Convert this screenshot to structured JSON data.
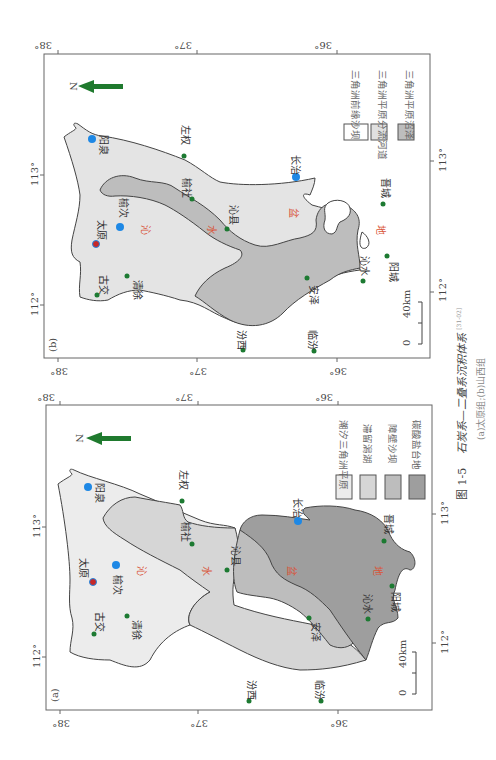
{
  "figure": {
    "number": "图 1-5",
    "title": "石炭系—二叠系沉积体系",
    "citation": "[31-02]",
    "subtitle": "(a)太原组;(b)山西组"
  },
  "common": {
    "north_label": "N",
    "scale_zero": "0",
    "scale_label": "40km",
    "lat_ticks": [
      "38°",
      "37°",
      "36°"
    ],
    "lon_ticks": [
      "113°",
      "112°"
    ],
    "basin_chars": [
      "沁",
      "水",
      "盆",
      "地"
    ],
    "colors": {
      "north_arrow": "#1f7a2e",
      "city_dot": "#1d7a32",
      "major_city": "#1e88e5",
      "capital": "#c62828",
      "basin_text": "#d9553a"
    }
  },
  "maps": {
    "a": {
      "label": "(a)",
      "legend": [
        {
          "label": "潮汐三角洲平原",
          "fill": "#ececec"
        },
        {
          "label": "滞留潟湖",
          "fill": "#d6d6d6"
        },
        {
          "label": "障壁沙坝",
          "fill": "#bdbdbd"
        },
        {
          "label": "碳酸盐台地",
          "fill": "#9e9e9e"
        }
      ],
      "cities": {
        "yangquan": "阳泉",
        "taiyuan": "太原",
        "yuci": "榆次",
        "gujiao": "古交",
        "qingxu": "清徐",
        "zuoquan": "左权",
        "yushe": "榆社",
        "qinxian": "沁县",
        "changzhi": "长治",
        "jincheng": "晋城",
        "yangcheng": "阳城",
        "qinshui": "沁水",
        "anze": "安泽",
        "fenxi": "汾西",
        "linfen": "临汾"
      }
    },
    "b": {
      "label": "(b)",
      "legend": [
        {
          "label": "三角洲前缘沙坝",
          "fill": "#ffffff"
        },
        {
          "label": "三角洲平原分流河道",
          "fill": "#e0e0e0"
        },
        {
          "label": "三角洲平原沼泽",
          "fill": "#bdbdbd"
        }
      ],
      "cities": {
        "yangquan": "阳泉",
        "taiyuan": "太原",
        "yuci": "榆次",
        "gujiao": "古交",
        "qingxu": "清徐",
        "zuoquan": "左权",
        "yushe": "榆社",
        "qinxian": "沁县",
        "changzhi": "长治",
        "jincheng": "晋城",
        "yangcheng": "阳城",
        "qinshui": "沁水",
        "anze": "安泽",
        "fenxi": "汾西",
        "linfen": "临汾"
      }
    }
  }
}
